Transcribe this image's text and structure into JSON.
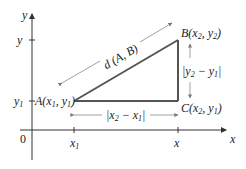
{
  "axes": {
    "x_label": "x",
    "y_label": "y",
    "origin_label": "0"
  },
  "ticks": {
    "x1_main": "x",
    "x1_sub": "1",
    "x2_main": "x",
    "y1_main": "y",
    "y1_sub": "1",
    "y2_main": "y"
  },
  "points": {
    "A": {
      "name": "A",
      "label_open": "(",
      "x": "x",
      "x_sub": "1",
      "sep": ", ",
      "y": "y",
      "y_sub": "1",
      "label_close": ")"
    },
    "B": {
      "name": "B",
      "label_open": "(",
      "x": "x",
      "x_sub": "2",
      "sep": ", ",
      "y": "y",
      "y_sub": "2",
      "label_close": ")"
    },
    "C": {
      "name": "C",
      "label_open": "(",
      "x": "x",
      "x_sub": "2",
      "sep": ", ",
      "y": "y",
      "y_sub": "1",
      "label_close": ")"
    }
  },
  "measures": {
    "distance": "d (A, B)",
    "horizontal": {
      "open": "|",
      "a": "x",
      "a_sub": "2",
      "minus": " − ",
      "b": "x",
      "b_sub": "1",
      "close": "|"
    },
    "vertical": {
      "open": "|",
      "a": "y",
      "a_sub": "2",
      "minus": " − ",
      "b": "y",
      "b_sub": "1",
      "close": "|"
    }
  },
  "colors": {
    "triangle": "#555555",
    "axis": "#333333",
    "arrow": "#888888"
  }
}
